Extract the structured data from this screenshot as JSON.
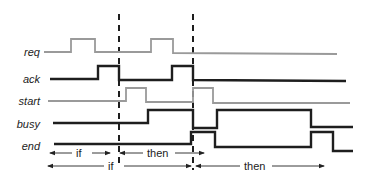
{
  "diagram": {
    "type": "timing-diagram",
    "colors": {
      "thin_signal": "#9a9a9a",
      "thick_signal": "#1e1e1e",
      "marker": "#1e1e1e",
      "text": "#222222"
    },
    "signals": [
      {
        "name": "req",
        "style": "thin",
        "label_y": 52,
        "points": "44,52 71,52 71,39 95,39 95,52 151,52 151,39 173,39 173,53 337,54"
      },
      {
        "name": "ack",
        "style": "thick",
        "label_y": 79,
        "points": "50,79 98,79 98,66 119,66 119,80 172,80 172,66 193,66 193,80 346,81"
      },
      {
        "name": "start",
        "style": "thin",
        "label_y": 101,
        "points": "48,101 126,101 126,88 146,88 146,102 193,102 193,88 213,88 213,103 350,103"
      },
      {
        "name": "busy",
        "style": "thick",
        "label_y": 124,
        "points": "53,123 148,123 148,110 193,110 193,128 217,128 217,110 311,110 311,127 353,127"
      },
      {
        "name": "end",
        "style": "thick",
        "label_y": 146,
        "points": "54,144 191,144 191,132 215,132 215,147 311,147 311,132 333,132 333,151 353,151"
      }
    ],
    "markers": [
      {
        "name": "marker-1",
        "x": 119,
        "y1": 14,
        "y2": 164
      },
      {
        "name": "marker-2",
        "x": 193,
        "y1": 14,
        "y2": 170
      }
    ],
    "intervals": [
      {
        "label": "if",
        "row": 1,
        "x1": 50,
        "x2": 110,
        "y": 153,
        "text_x": 76
      },
      {
        "label": "then",
        "row": 1,
        "x1": 120,
        "x2": 204,
        "y": 153,
        "text_x": 147
      },
      {
        "label": "if",
        "row": 2,
        "x1": 48,
        "x2": 191,
        "y": 166,
        "text_x": 108
      },
      {
        "label": "then",
        "row": 2,
        "x1": 196,
        "x2": 324,
        "y": 166,
        "text_x": 244
      }
    ]
  }
}
